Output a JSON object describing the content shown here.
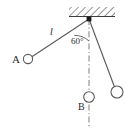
{
  "figure": {
    "background_color": "#ffffff",
    "line_color": "#4a4a4a",
    "text_color": "#2b2b2b",
    "width": 137,
    "height": 130
  },
  "labels": {
    "bob_a": "A",
    "bob_b": "B",
    "string_length": "l",
    "angle": "60°"
  },
  "geometry": {
    "pivot": {
      "x": 89,
      "y": 19
    },
    "bob_a": {
      "x": 28,
      "y": 59,
      "r": 5
    },
    "bob_b": {
      "x": 89,
      "y": 97,
      "r": 5.5
    },
    "bob_c": {
      "x": 117,
      "y": 92,
      "r": 6
    },
    "ceiling": {
      "x": 69,
      "y": 7,
      "width": 46,
      "height": 9
    },
    "vertical_line": {
      "x": 89,
      "y_top": 19,
      "y_bottom": 127
    },
    "angle_arc_radius": 22
  },
  "elements": {
    "ceiling_name": "hatched-ceiling",
    "pivot_name": "pivot-point",
    "string_a_name": "string-to-bob-a",
    "string_c_name": "string-to-bob-c",
    "vertical_name": "vertical-reference-line",
    "arc_name": "angle-arc"
  }
}
